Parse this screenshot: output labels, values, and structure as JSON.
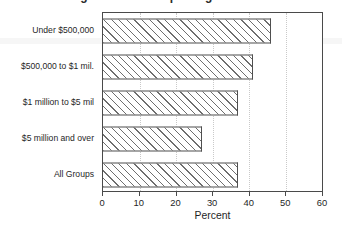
{
  "figure": {
    "title_clipped": "Percentage of Farms Reporting",
    "background_color": "#ffffff"
  },
  "chart_data": {
    "type": "bar",
    "orientation": "horizontal",
    "title": "",
    "xlabel": "Percent",
    "ylabel": "",
    "categories": [
      "Under $500,000",
      "$500,000 to $1 mil.",
      "$1 million to $5 mil",
      "$5 million and over",
      "All Groups"
    ],
    "values": [
      46,
      41,
      37,
      27,
      37
    ],
    "xlim": [
      0,
      60
    ],
    "xticks": [
      0,
      10,
      20,
      30,
      40,
      50,
      60
    ],
    "xticklabels": [
      "0",
      "10",
      "20",
      "30",
      "40",
      "50",
      "60"
    ],
    "grid": true,
    "legend": false,
    "bar_style": {
      "fill": "diagonal-hatch",
      "hatch_color": "#6e6e6e",
      "face_color": "#ffffff",
      "edge_color": "#4f4f4f"
    }
  }
}
